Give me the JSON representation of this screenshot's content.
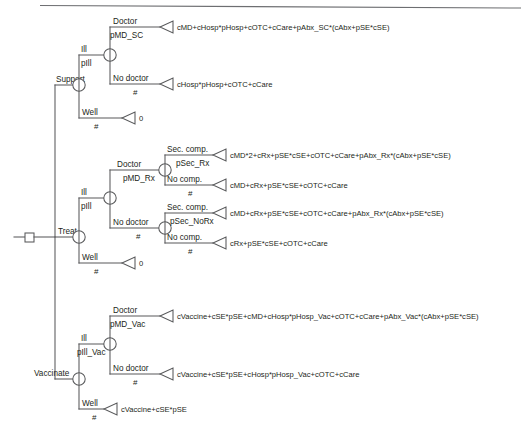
{
  "diagram": {
    "root_label": "Treat",
    "top_rule": true,
    "colors": {
      "line": "#58595b",
      "text": "#231f20",
      "background": "#ffffff",
      "rule": "#6d6e71"
    },
    "branch_labels": {
      "support": "Support",
      "treat": "Treat",
      "vaccinate": "Vaccinate",
      "ill": "Ill",
      "well": "Well",
      "doctor": "Doctor",
      "no_doctor": "No doctor",
      "sec_comp": "Sec. comp.",
      "no_comp": "No comp."
    },
    "probabilities": {
      "pIll": "pIll",
      "pIll_Vac": "pIll_Vac",
      "pMD_SC": "pMD_SC",
      "pMD_Rx": "pMD_Rx",
      "pMD_Vac": "pMD_Vac",
      "pSec_Rx": "pSec_Rx",
      "pSec_NoRx": "pSec_NoRx",
      "complement": "#"
    },
    "payoffs": {
      "support_doctor": "cMD+cHosp*pHosp+cOTC+cCare+pAbx_SC*(cAbx+pSE*cSE)",
      "support_no_doctor": "cHosp*pHosp+cOTC+cCare",
      "support_well": "0",
      "treat_doctor_sec_comp": "cMD*2+cRx+pSE*cSE+cOTC+cCare+pAbx_Rx*(cAbx+pSE*cSE)",
      "treat_doctor_no_comp": "cMD+cRx+pSE*cSE+cOTC+cCare",
      "treat_no_doctor_sec_comp": "cMD+cRx+pSE*cSE+cOTC+cCare+pAbx_Rx*(cAbx+pSE*cSE)",
      "treat_no_doctor_no_comp": "cRx+pSE*cSE+cOTC+cCare",
      "treat_well": "0",
      "vaccinate_doctor": "cVaccine+cSE*pSE+cMD+cHosp*pHosp_Vac+cOTC+cCare+pAbx_Vac*(cAbx+pSE*cSE)",
      "vaccinate_no_doctor": "cVaccine+cSE*pSE+cHosp*pHosp_Vac+cOTC+cCare",
      "vaccinate_well": "cVaccine+cSE*pSE"
    }
  }
}
